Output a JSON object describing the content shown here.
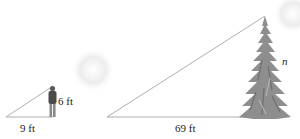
{
  "diagram": {
    "type": "similar-triangles",
    "small_triangle": {
      "base_label": "9 ft",
      "height_label": "6 ft",
      "object": "person"
    },
    "large_triangle": {
      "base_label": "69 ft",
      "height_label": "n",
      "object": "pine-tree"
    }
  },
  "colors": {
    "line": "#9a9a9a",
    "tree": "#8e8e8e",
    "tree_dark": "#6e6e6e",
    "person_body": "#4a4a4a",
    "person_legs": "#8a8a8a",
    "text": "#222222"
  }
}
